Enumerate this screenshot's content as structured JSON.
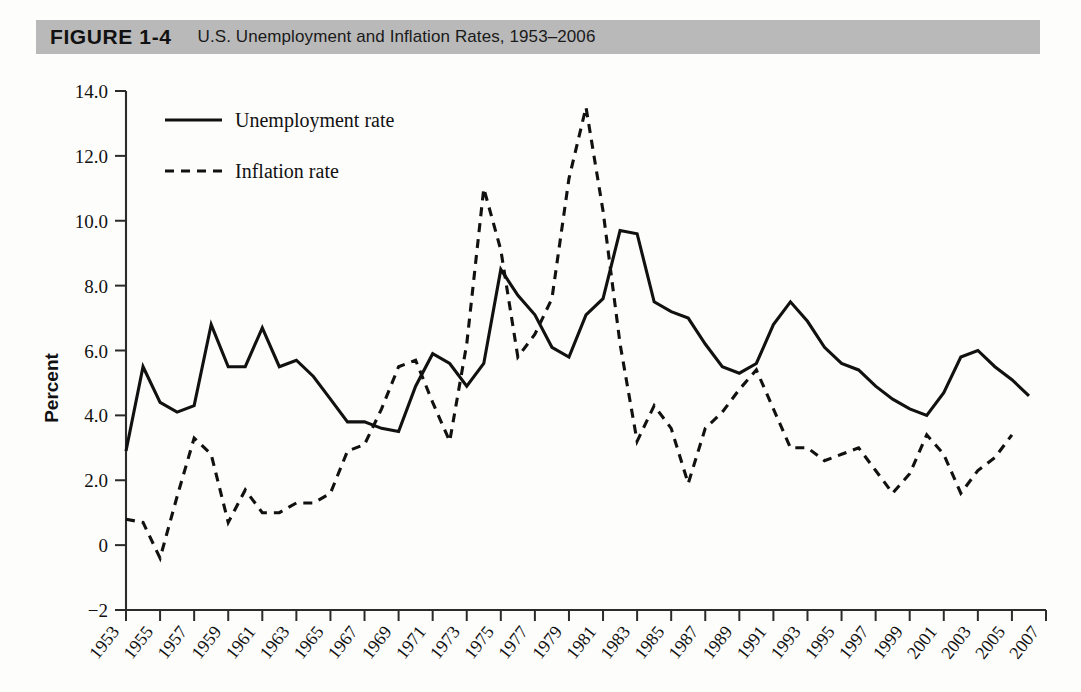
{
  "header": {
    "figure_label": "FIGURE 1-4",
    "caption": "U.S. Unemployment and Inflation Rates, 1953–2006"
  },
  "legend": {
    "position": "top-left-inside",
    "items": [
      {
        "label": "Unemployment rate",
        "style": "solid"
      },
      {
        "label": "Inflation rate",
        "style": "dashed"
      }
    ]
  },
  "axes": {
    "ylabel": "Percent",
    "xlabel": "",
    "ytick_labels": [
      "14.0",
      "12.0",
      "10.0",
      "8.0",
      "6.0",
      "4.0",
      "2.0",
      "0",
      "−2"
    ],
    "ytick_values": [
      14,
      12,
      10,
      8,
      6,
      4,
      2,
      0,
      -2
    ],
    "xtick_labels": [
      "1953",
      "1955",
      "1957",
      "1959",
      "1961",
      "1963",
      "1965",
      "1967",
      "1969",
      "1971",
      "1973",
      "1975",
      "1977",
      "1979",
      "1981",
      "1983",
      "1985",
      "1987",
      "1989",
      "1991",
      "1993",
      "1995",
      "1997",
      "1999",
      "2001",
      "2003",
      "2005",
      "2007"
    ],
    "xtick_values": [
      1953,
      1955,
      1957,
      1959,
      1961,
      1963,
      1965,
      1967,
      1969,
      1971,
      1973,
      1975,
      1977,
      1979,
      1981,
      1983,
      1985,
      1987,
      1989,
      1991,
      1993,
      1995,
      1997,
      1999,
      2001,
      2003,
      2005,
      2007
    ]
  },
  "colors": {
    "header_band": "#b9b9b9",
    "ink": "#111111",
    "page": "#fdfdfc"
  },
  "chart_data": {
    "type": "line",
    "title": "U.S. Unemployment and Inflation Rates, 1953–2006",
    "xlabel": "",
    "ylabel": "Percent",
    "xlim": [
      1953,
      2007
    ],
    "ylim": [
      -2,
      14
    ],
    "grid": false,
    "legend_position": "upper left",
    "x": [
      1953,
      1954,
      1955,
      1956,
      1957,
      1958,
      1959,
      1960,
      1961,
      1962,
      1963,
      1964,
      1965,
      1966,
      1967,
      1968,
      1969,
      1970,
      1971,
      1972,
      1973,
      1974,
      1975,
      1976,
      1977,
      1978,
      1979,
      1980,
      1981,
      1982,
      1983,
      1984,
      1985,
      1986,
      1987,
      1988,
      1989,
      1990,
      1991,
      1992,
      1993,
      1994,
      1995,
      1996,
      1997,
      1998,
      1999,
      2000,
      2001,
      2002,
      2003,
      2004,
      2005,
      2006
    ],
    "series": [
      {
        "name": "Unemployment rate",
        "style": "solid",
        "values": [
          2.9,
          5.5,
          4.4,
          4.1,
          4.3,
          6.8,
          5.5,
          5.5,
          6.7,
          5.5,
          5.7,
          5.2,
          4.5,
          3.8,
          3.8,
          3.6,
          3.5,
          4.9,
          5.9,
          5.6,
          4.9,
          5.6,
          8.5,
          7.7,
          7.1,
          6.1,
          5.8,
          7.1,
          7.6,
          9.7,
          9.6,
          7.5,
          7.2,
          7.0,
          6.2,
          5.5,
          5.3,
          5.6,
          6.8,
          7.5,
          6.9,
          6.1,
          5.6,
          5.4,
          4.9,
          4.5,
          4.2,
          4.0,
          4.7,
          5.8,
          6.0,
          5.5,
          5.1,
          4.6
        ]
      },
      {
        "name": "Inflation rate",
        "style": "dashed",
        "values": [
          0.8,
          0.7,
          -0.4,
          1.5,
          3.3,
          2.8,
          0.7,
          1.7,
          1.0,
          1.0,
          1.3,
          1.3,
          1.6,
          2.9,
          3.1,
          4.2,
          5.5,
          5.7,
          4.4,
          3.2,
          6.2,
          11.0,
          9.1,
          5.8,
          6.5,
          7.6,
          11.3,
          13.5,
          10.3,
          6.2,
          3.2,
          4.3,
          3.6,
          1.9,
          3.6,
          4.1,
          4.8,
          5.4,
          4.2,
          3.0,
          3.0,
          2.6,
          2.8,
          3.0,
          2.3,
          1.6,
          2.2,
          3.4,
          2.8,
          1.6,
          2.3,
          2.7,
          3.4,
          null
        ]
      }
    ]
  }
}
